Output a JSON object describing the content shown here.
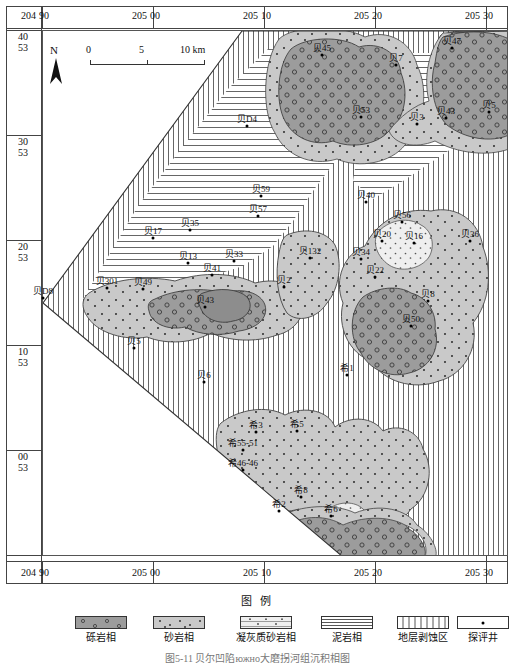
{
  "figure": {
    "legend_title": "图 例",
    "caption": "图5-11  贝尔凹陷южно大磨拐河组沉积相图"
  },
  "scalebar": {
    "ticks": [
      "0",
      "5",
      "10 km"
    ],
    "north_letter": "N"
  },
  "axes": {
    "x_labels": [
      {
        "major": "204",
        "minor": "90"
      },
      {
        "major": "205",
        "minor": "00"
      },
      {
        "major": "205",
        "minor": "10"
      },
      {
        "major": "205",
        "minor": "20"
      },
      {
        "major": "205",
        "minor": "30"
      }
    ],
    "y_labels": [
      {
        "top": "40",
        "bottom": "53"
      },
      {
        "top": "30",
        "bottom": "53"
      },
      {
        "top": "20",
        "bottom": "53"
      },
      {
        "top": "10",
        "bottom": "53"
      },
      {
        "top": "00",
        "bottom": "53"
      }
    ]
  },
  "legend": {
    "items": [
      {
        "key": "gravel",
        "label": "砾岩相",
        "color": "#9c9c9c"
      },
      {
        "key": "sand",
        "label": "砂岩相",
        "color": "#c9c9c9"
      },
      {
        "key": "tuff",
        "label": "凝灰质砂岩相",
        "color": "#efefef"
      },
      {
        "key": "mud",
        "label": "泥岩相",
        "color": "#ffffff"
      },
      {
        "key": "eroded",
        "label": "地层剥蚀区",
        "color": "#ffffff"
      },
      {
        "key": "well",
        "label": "探评井",
        "color": "#ffffff"
      }
    ]
  },
  "wells": [
    {
      "name": "贝45",
      "x": 322,
      "y": 55
    },
    {
      "name": "贝7",
      "x": 396,
      "y": 65
    },
    {
      "name": "贝47",
      "x": 452,
      "y": 48
    },
    {
      "name": "贝53",
      "x": 361,
      "y": 117
    },
    {
      "name": "贝3",
      "x": 417,
      "y": 124
    },
    {
      "name": "贝43",
      "x": 446,
      "y": 118
    },
    {
      "name": "贝5",
      "x": 489,
      "y": 112
    },
    {
      "name": "贝D4",
      "x": 247,
      "y": 126
    },
    {
      "name": "贝59",
      "x": 261,
      "y": 196
    },
    {
      "name": "贝57",
      "x": 258,
      "y": 216
    },
    {
      "name": "贝40",
      "x": 366,
      "y": 202
    },
    {
      "name": "贝56",
      "x": 402,
      "y": 222
    },
    {
      "name": "贝17",
      "x": 153,
      "y": 238
    },
    {
      "name": "贝35",
      "x": 190,
      "y": 230
    },
    {
      "name": "贝20",
      "x": 382,
      "y": 241
    },
    {
      "name": "贝16",
      "x": 414,
      "y": 243
    },
    {
      "name": "贝36",
      "x": 470,
      "y": 241
    },
    {
      "name": "贝13",
      "x": 188,
      "y": 263
    },
    {
      "name": "贝33",
      "x": 234,
      "y": 261
    },
    {
      "name": "贝132",
      "x": 310,
      "y": 258
    },
    {
      "name": "贝34",
      "x": 361,
      "y": 259
    },
    {
      "name": "贝41",
      "x": 212,
      "y": 275
    },
    {
      "name": "贝22",
      "x": 375,
      "y": 277
    },
    {
      "name": "贝2",
      "x": 284,
      "y": 287
    },
    {
      "name": "贝301",
      "x": 107,
      "y": 288
    },
    {
      "name": "贝49",
      "x": 143,
      "y": 289
    },
    {
      "name": "贝8",
      "x": 428,
      "y": 301
    },
    {
      "name": "贝D8",
      "x": 43,
      "y": 298
    },
    {
      "name": "贝43",
      "x": 205,
      "y": 307
    },
    {
      "name": "贝50",
      "x": 411,
      "y": 326
    },
    {
      "name": "贝5",
      "x": 134,
      "y": 348
    },
    {
      "name": "贝6",
      "x": 204,
      "y": 382
    },
    {
      "name": "希1",
      "x": 347,
      "y": 375
    },
    {
      "name": "希3",
      "x": 256,
      "y": 432
    },
    {
      "name": "希5",
      "x": 297,
      "y": 431
    },
    {
      "name": "希55-51",
      "x": 243,
      "y": 450
    },
    {
      "name": "希46-46",
      "x": 243,
      "y": 470
    },
    {
      "name": "希8",
      "x": 301,
      "y": 497
    },
    {
      "name": "希2",
      "x": 279,
      "y": 511
    },
    {
      "name": "希6",
      "x": 331,
      "y": 516
    }
  ]
}
